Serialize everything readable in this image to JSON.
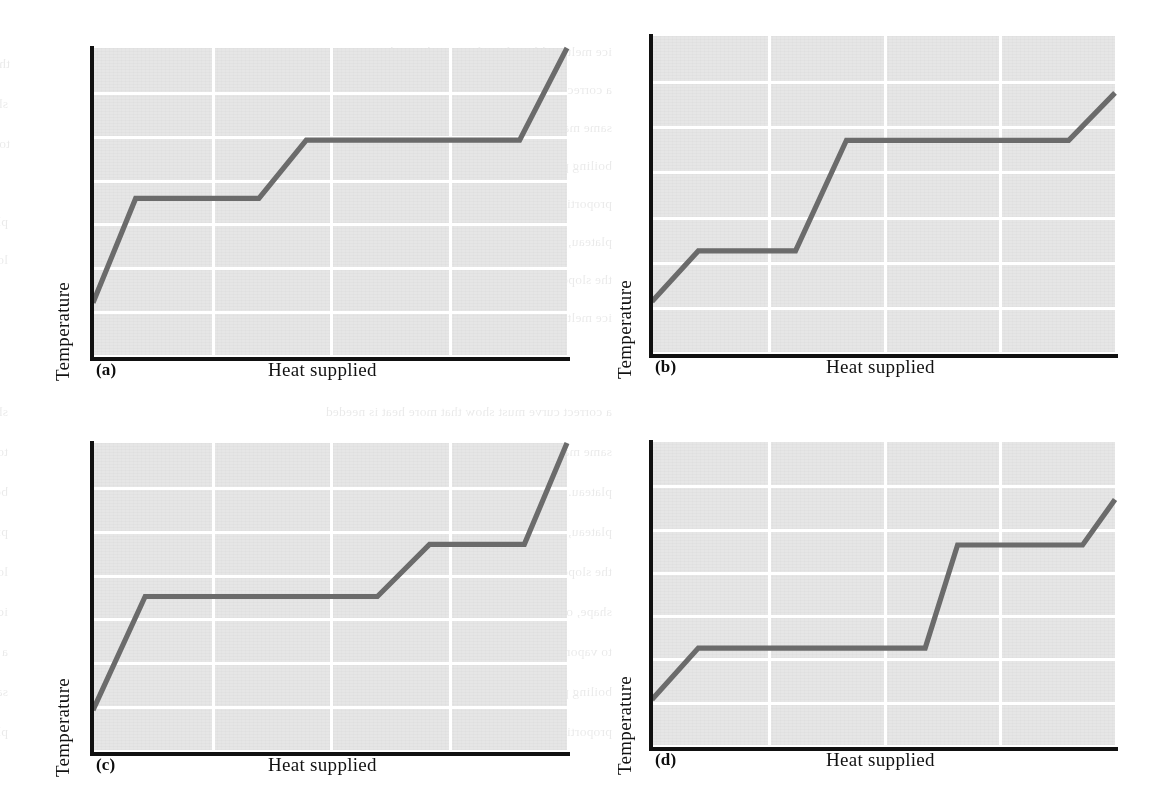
{
  "figure": {
    "caption_style": "four-panel multiple-choice heating curve figure",
    "line_color": "#6b6b6b",
    "axis_color": "#111111",
    "plot_bg_color": "#e6e6e6",
    "gridline_color": "#ffffff"
  },
  "ghost_text": [
    "the slope of the curve, and in the upper region, the",
    "ice melts. Although each curve shows the same",
    "shape, only one of them is correct for water, because",
    "a correct curve must show that more heat is needed",
    "to vaporize a given mass of water than to melt the",
    "same mass of ice, and the temperature of the",
    "boiling plateau must lie above that of the melting",
    "plateau. The heat needed per unit mass is",
    "proportional to the horizontal length of each",
    "plateau, so the vaporization plateau must be the",
    "longer of the two segments in the graph."
  ],
  "panels": [
    {
      "id": "a",
      "letter": "(a)",
      "ylabel": "Temperature",
      "xlabel": "Heat supplied",
      "chart_data": {
        "type": "line",
        "title": "Heating curve (a)",
        "xlabel": "Heat supplied",
        "ylabel": "Temperature",
        "xlim": [
          0,
          100
        ],
        "ylim": [
          0,
          100
        ],
        "grid": true,
        "grid_cols": 4,
        "grid_rows": 7,
        "legend": "none",
        "series": [
          {
            "name": "temperature vs heat supplied",
            "points": [
              {
                "x": 0,
                "y": 17
              },
              {
                "x": 9,
                "y": 51
              },
              {
                "x": 35,
                "y": 51
              },
              {
                "x": 45,
                "y": 70
              },
              {
                "x": 90,
                "y": 70
              },
              {
                "x": 100,
                "y": 100
              }
            ]
          }
        ],
        "annotations": [
          "melting plateau spans x 9 to 35 (length 26)",
          "boiling plateau spans x 45 to 90 (length 45)",
          "boiling plateau is longer than melting plateau"
        ]
      }
    },
    {
      "id": "b",
      "letter": "(b)",
      "ylabel": "Temperature",
      "xlabel": "Heat supplied",
      "chart_data": {
        "type": "line",
        "title": "Heating curve (b)",
        "xlabel": "Heat supplied",
        "ylabel": "Temperature",
        "xlim": [
          0,
          100
        ],
        "ylim": [
          0,
          100
        ],
        "grid": true,
        "grid_cols": 4,
        "grid_rows": 7,
        "legend": "none",
        "series": [
          {
            "name": "temperature vs heat supplied",
            "points": [
              {
                "x": 0,
                "y": 16
              },
              {
                "x": 10,
                "y": 32
              },
              {
                "x": 31,
                "y": 32
              },
              {
                "x": 42,
                "y": 67
              },
              {
                "x": 90,
                "y": 67
              },
              {
                "x": 100,
                "y": 82
              }
            ]
          }
        ],
        "annotations": [
          "melting plateau spans x 10 to 31 (length 21)",
          "boiling plateau spans x 42 to 90 (length 48)",
          "boiling plateau is longer than melting plateau"
        ]
      }
    },
    {
      "id": "c",
      "letter": "(c)",
      "ylabel": "Temperature",
      "xlabel": "Heat supplied",
      "chart_data": {
        "type": "line",
        "title": "Heating curve (c)",
        "xlabel": "Heat supplied",
        "ylabel": "Temperature",
        "xlim": [
          0,
          100
        ],
        "ylim": [
          0,
          100
        ],
        "grid": true,
        "grid_cols": 4,
        "grid_rows": 7,
        "legend": "none",
        "series": [
          {
            "name": "temperature vs heat supplied",
            "points": [
              {
                "x": 0,
                "y": 13
              },
              {
                "x": 11,
                "y": 50
              },
              {
                "x": 60,
                "y": 50
              },
              {
                "x": 71,
                "y": 67
              },
              {
                "x": 91,
                "y": 67
              },
              {
                "x": 100,
                "y": 100
              }
            ]
          }
        ],
        "annotations": [
          "melting plateau spans x 11 to 60 (length 49)",
          "boiling plateau spans x 71 to 91 (length 20)",
          "melting plateau is longer than boiling plateau"
        ]
      }
    },
    {
      "id": "d",
      "letter": "(d)",
      "ylabel": "Temperature",
      "xlabel": "Heat supplied",
      "chart_data": {
        "type": "line",
        "title": "Heating curve (d)",
        "xlabel": "Heat supplied",
        "ylabel": "Temperature",
        "xlim": [
          0,
          100
        ],
        "ylim": [
          0,
          100
        ],
        "grid": true,
        "grid_cols": 4,
        "grid_rows": 7,
        "legend": "none",
        "series": [
          {
            "name": "temperature vs heat supplied",
            "points": [
              {
                "x": 0,
                "y": 15
              },
              {
                "x": 10,
                "y": 32
              },
              {
                "x": 59,
                "y": 32
              },
              {
                "x": 66,
                "y": 66
              },
              {
                "x": 93,
                "y": 66
              },
              {
                "x": 100,
                "y": 81
              }
            ]
          }
        ],
        "annotations": [
          "melting plateau spans x 10 to 59 (length 49)",
          "boiling plateau spans x 66 to 93 (length 27)",
          "melting plateau is longer than boiling plateau"
        ]
      }
    }
  ]
}
